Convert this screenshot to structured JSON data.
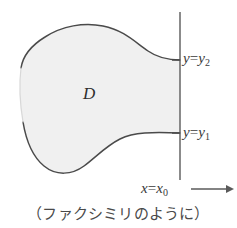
{
  "figure": {
    "kind": "math-diagram",
    "region": {
      "name": "region-D",
      "label": "D",
      "fill_color": "#f0f0f0",
      "stroke_color": "#4a4a4a"
    },
    "vertical_line": {
      "name": "line-x-equals-x0",
      "x": 180,
      "y_top": 12,
      "y_bottom": 180,
      "color": "#6e6e6e"
    },
    "intersections": [
      {
        "name": "upper",
        "y": 60,
        "label": "y=y2"
      },
      {
        "name": "lower",
        "y": 133,
        "label": "y=y1"
      }
    ],
    "labels": {
      "y_upper": {
        "var": "y",
        "op": "=",
        "base": "y",
        "sub": "2"
      },
      "y_lower": {
        "var": "y",
        "op": "=",
        "base": "y",
        "sub": "1"
      },
      "x_line": {
        "var": "x",
        "op": "=",
        "base": "x",
        "sub": "0"
      },
      "arrow": "⟶"
    },
    "caption": "（ファクシミリのように）"
  }
}
